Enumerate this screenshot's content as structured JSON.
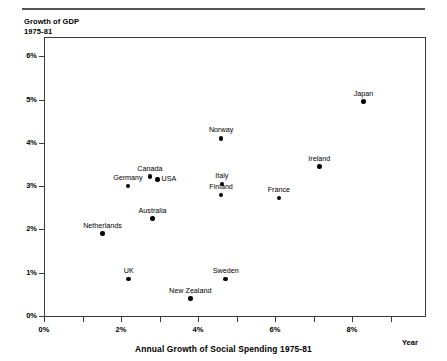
{
  "chart_data": {
    "type": "scatter",
    "title": "Growth of GDP\n1975-81",
    "ylabel": "Growth of GDP 1975-81",
    "xlabel": "Annual Growth of Social Spending 1975-81",
    "x_axis_end_label": "Year",
    "xlim": [
      0,
      9.9
    ],
    "ylim": [
      0,
      6.5
    ],
    "grid": false,
    "legend": "none",
    "x_ticks": [
      {
        "value": 0,
        "label": "0%",
        "major": true
      },
      {
        "value": 1,
        "label": "",
        "major": false
      },
      {
        "value": 2,
        "label": "2%",
        "major": true
      },
      {
        "value": 3,
        "label": "",
        "major": false
      },
      {
        "value": 4,
        "label": "4%",
        "major": true
      },
      {
        "value": 5,
        "label": "",
        "major": false
      },
      {
        "value": 6,
        "label": "6%",
        "major": true
      },
      {
        "value": 7,
        "label": "",
        "major": false
      },
      {
        "value": 8,
        "label": "8%",
        "major": true
      },
      {
        "value": 9,
        "label": "",
        "major": false
      }
    ],
    "y_ticks": [
      {
        "value": 0,
        "label": "0%"
      },
      {
        "value": 1,
        "label": "1%"
      },
      {
        "value": 2,
        "label": "2%"
      },
      {
        "value": 3,
        "label": "3%"
      },
      {
        "value": 4,
        "label": "4%"
      },
      {
        "value": 5,
        "label": "5%"
      },
      {
        "value": 6,
        "label": "6%"
      }
    ],
    "points": [
      {
        "label": "Japan",
        "x": 8.3,
        "y": 4.95,
        "label_pos": "above"
      },
      {
        "label": "Norway",
        "x": 4.6,
        "y": 4.1,
        "label_pos": "above"
      },
      {
        "label": "Ireland",
        "x": 7.15,
        "y": 3.45,
        "label_pos": "above"
      },
      {
        "label": "Canada",
        "x": 2.75,
        "y": 3.22,
        "label_pos": "above"
      },
      {
        "label": "USA",
        "x": 2.95,
        "y": 3.15,
        "label_pos": "right"
      },
      {
        "label": "Italy",
        "x": 4.62,
        "y": 3.05,
        "label_pos": "above"
      },
      {
        "label": "Germany",
        "x": 2.18,
        "y": 3.0,
        "label_pos": "above"
      },
      {
        "label": "Finland",
        "x": 4.6,
        "y": 2.8,
        "label_pos": "above"
      },
      {
        "label": "France",
        "x": 6.1,
        "y": 2.72,
        "label_pos": "above"
      },
      {
        "label": "Australia",
        "x": 2.82,
        "y": 2.25,
        "label_pos": "above"
      },
      {
        "label": "Netherlands",
        "x": 1.52,
        "y": 1.9,
        "label_pos": "above"
      },
      {
        "label": "UK",
        "x": 2.2,
        "y": 0.85,
        "label_pos": "above"
      },
      {
        "label": "Sweden",
        "x": 4.72,
        "y": 0.85,
        "label_pos": "above"
      },
      {
        "label": "New Zealand",
        "x": 3.8,
        "y": 0.4,
        "label_pos": "above"
      }
    ]
  }
}
